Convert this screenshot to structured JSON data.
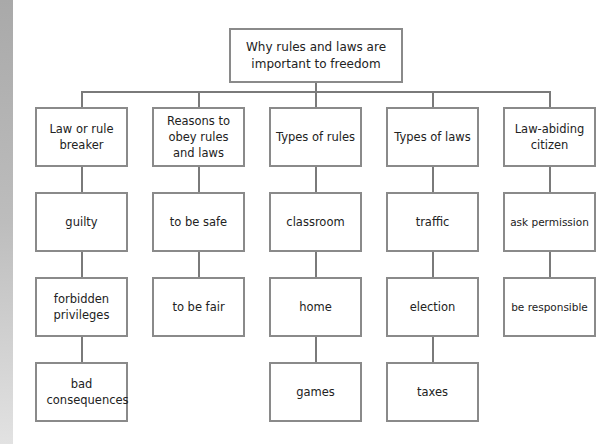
{
  "diagram": {
    "title": "Why rules and laws are important to freedom",
    "columns": [
      {
        "heading": "Law or rule breaker",
        "items": [
          "guilty",
          "forbidden privileges",
          "bad consequences"
        ]
      },
      {
        "heading": "Reasons to obey rules and laws",
        "items": [
          "to be safe",
          "to be fair"
        ]
      },
      {
        "heading": "Types of rules",
        "items": [
          "classroom",
          "home",
          "games"
        ]
      },
      {
        "heading": "Types of laws",
        "items": [
          "traffic",
          "election",
          "taxes"
        ]
      },
      {
        "heading": "Law-abiding citizen",
        "items": [
          "ask permission",
          "be responsible"
        ]
      }
    ]
  },
  "colors": {
    "border": "#8a8a8a",
    "line": "#7a7a7a",
    "text": "#222222",
    "background": "#ffffff"
  }
}
